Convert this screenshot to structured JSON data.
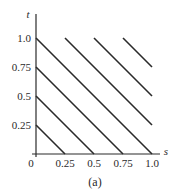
{
  "chart_data": {
    "type": "line",
    "title": "",
    "caption": "(a)",
    "xlabel": "s",
    "ylabel": "t",
    "xlim": [
      0,
      1.0
    ],
    "ylim": [
      0,
      1.0
    ],
    "grid": false,
    "legend": null,
    "x_ticks": [
      "0.25",
      "0.5",
      "0.75",
      "1.0"
    ],
    "y_ticks": [
      "0.25",
      "0.5",
      "0.75",
      "1.0"
    ],
    "origin_label": "0",
    "series": [
      {
        "name": "s+t=0.25",
        "points": [
          [
            0,
            0.25
          ],
          [
            0.25,
            0
          ]
        ]
      },
      {
        "name": "s+t=0.5",
        "points": [
          [
            0,
            0.5
          ],
          [
            0.5,
            0
          ]
        ]
      },
      {
        "name": "s+t=0.75",
        "points": [
          [
            0,
            0.75
          ],
          [
            0.75,
            0
          ]
        ]
      },
      {
        "name": "s+t=1.0",
        "points": [
          [
            0,
            1.0
          ],
          [
            1.0,
            0
          ]
        ]
      },
      {
        "name": "s+t=1.25",
        "points": [
          [
            0.25,
            1.0
          ],
          [
            1.0,
            0.25
          ]
        ]
      },
      {
        "name": "s+t=1.5",
        "points": [
          [
            0.5,
            1.0
          ],
          [
            1.0,
            0.5
          ]
        ]
      },
      {
        "name": "s+t=1.75",
        "points": [
          [
            0.75,
            1.0
          ],
          [
            1.0,
            0.75
          ]
        ]
      }
    ],
    "colors": {
      "line": "#2a2a2a",
      "axis": "#2a2a2a"
    }
  }
}
